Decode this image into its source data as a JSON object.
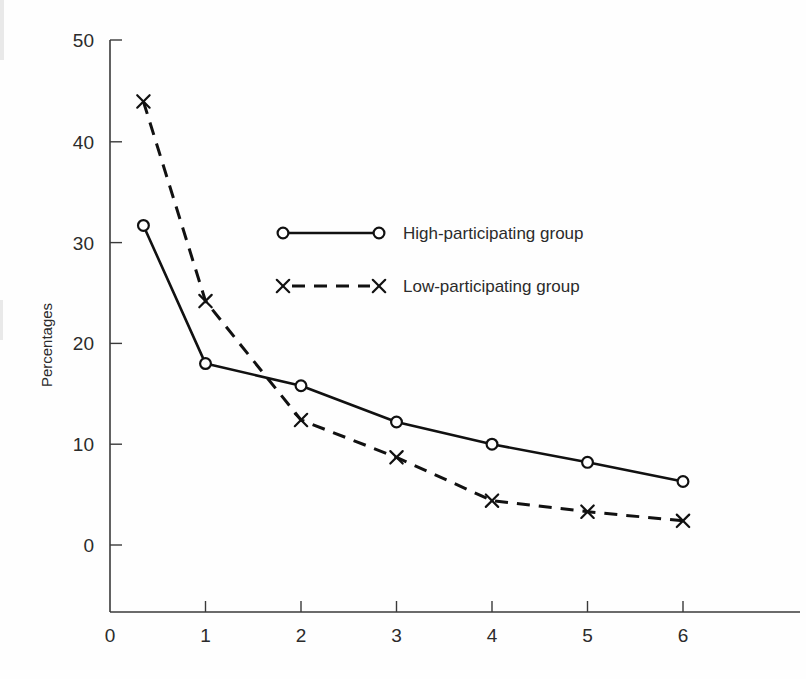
{
  "chart_data": {
    "type": "line",
    "title": "",
    "subtitle": "",
    "xlabel": "",
    "ylabel": "Percentages",
    "xlim": [
      0,
      6.6
    ],
    "ylim": [
      0,
      50
    ],
    "grid": false,
    "legend_position": "upper-center-right",
    "x_ticks": [
      "0",
      "1",
      "2",
      "3",
      "4",
      "5",
      "6"
    ],
    "x_tick_values": [
      0,
      1,
      2,
      3,
      4,
      5,
      6
    ],
    "y_ticks": [
      "0",
      "10",
      "20",
      "30",
      "40",
      "50"
    ],
    "y_tick_values": [
      0,
      10,
      20,
      30,
      40,
      50
    ],
    "series": [
      {
        "name": "High-participating group",
        "marker": "circle",
        "linestyle": "solid",
        "color": "#111111",
        "x": [
          0.35,
          1,
          2,
          3,
          4,
          5,
          6
        ],
        "values": [
          31.7,
          18.0,
          15.8,
          12.2,
          10.0,
          8.2,
          6.3
        ]
      },
      {
        "name": "Low-participating group",
        "marker": "x",
        "linestyle": "dashed",
        "color": "#111111",
        "x": [
          0.35,
          1,
          2,
          3,
          4,
          5,
          6
        ],
        "values": [
          44.0,
          24.2,
          12.4,
          8.7,
          4.4,
          3.3,
          2.4
        ]
      }
    ]
  },
  "legend": {
    "entries": [
      {
        "label": "High-participating group",
        "marker": "circle",
        "linestyle": "solid"
      },
      {
        "label": "Low-participating group",
        "marker": "x",
        "linestyle": "dashed"
      }
    ]
  },
  "axes": {
    "y_title": "Percentages"
  }
}
